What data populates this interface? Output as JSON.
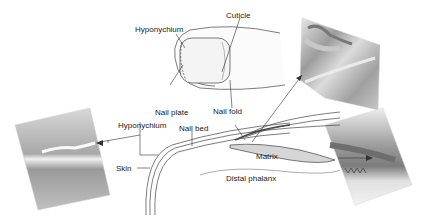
{
  "figure": {
    "labels": {
      "cuticle": "Cuticle",
      "hyponychium_top": "Hyponychium",
      "nail_plate": "Nail plate",
      "nail_fold": "Nail fold",
      "hyponychium_side": "Hyponychium",
      "nail_bed": "Nail bed",
      "skin": "Skin",
      "matrix": "Matrix",
      "distal_phalanx": "Distal phalanx"
    },
    "micrographs": [
      {
        "name": "left-micrograph",
        "region": "hyponychium"
      },
      {
        "name": "top-right-micrograph",
        "region": "nail-fold"
      },
      {
        "name": "bottom-right-micrograph",
        "region": "matrix"
      }
    ],
    "colors": {
      "line": "#333333",
      "nail_fill": "#f2f2f2",
      "matrix_fill": "#d4d4d4",
      "micrograph_dark": "#8a8a8a",
      "micrograph_mid": "#b5b5b5",
      "micrograph_light": "#e2e2e2"
    }
  }
}
